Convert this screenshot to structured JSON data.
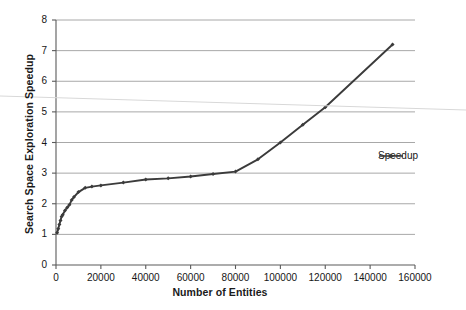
{
  "chart_data": {
    "type": "line",
    "title": "",
    "xlabel": "Number of Entities",
    "ylabel": "Search Space Exploration Speedup",
    "xlim": [
      0,
      160000
    ],
    "ylim": [
      0,
      8
    ],
    "xticks": [
      0,
      20000,
      40000,
      60000,
      80000,
      100000,
      120000,
      140000,
      160000
    ],
    "xtick_labels": [
      "0",
      "20000",
      "40000",
      "60000",
      "80000",
      "100000",
      "120000",
      "140000",
      "160000"
    ],
    "yticks": [
      0,
      1,
      2,
      3,
      4,
      5,
      6,
      7,
      8
    ],
    "ytick_labels": [
      "0",
      "1",
      "2",
      "3",
      "4",
      "5",
      "6",
      "7",
      "8"
    ],
    "grid": "horizontal",
    "legend_position": "right",
    "marker": "diamond",
    "line_color": "#3b3b3b",
    "grid_color": "#a8a8a8",
    "axis_color": "#5a5a5a",
    "series": [
      {
        "name": "Speedup",
        "x": [
          500,
          1000,
          1500,
          2000,
          2500,
          3000,
          4000,
          5000,
          6000,
          7000,
          8000,
          10000,
          13000,
          16000,
          20000,
          30000,
          40000,
          50000,
          60000,
          70000,
          80000,
          90000,
          100000,
          110000,
          120000,
          150000
        ],
        "values": [
          1.05,
          1.18,
          1.32,
          1.45,
          1.58,
          1.64,
          1.78,
          1.88,
          1.97,
          2.12,
          2.22,
          2.38,
          2.52,
          2.56,
          2.6,
          2.69,
          2.79,
          2.83,
          2.89,
          2.97,
          3.05,
          3.45,
          4.0,
          4.58,
          5.15,
          7.2
        ]
      }
    ]
  },
  "legend": {
    "entries": [
      {
        "label": "Speedup"
      }
    ]
  },
  "artifact": {
    "name": "scan-line"
  }
}
